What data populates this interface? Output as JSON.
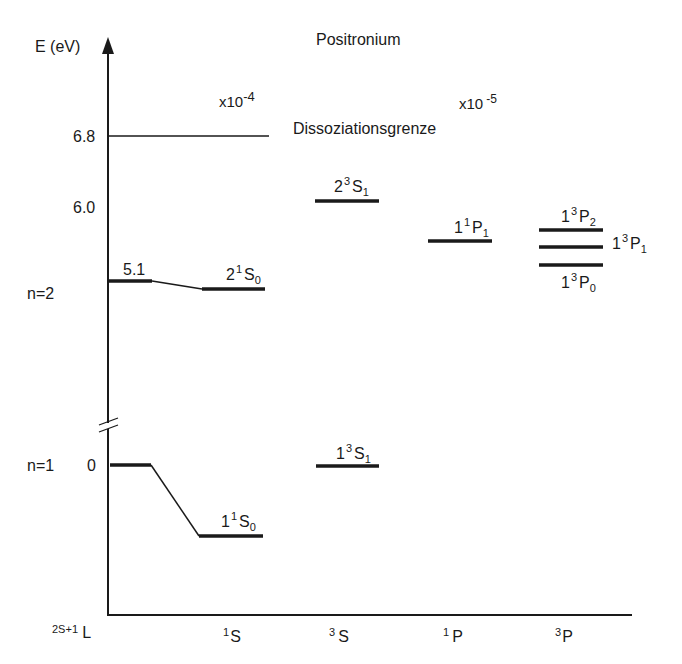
{
  "title": "Positronium",
  "y_axis": {
    "label": "E (eV)",
    "ticks": [
      "6.8",
      "6.0"
    ],
    "shell_labels": [
      "n=2",
      "n=1"
    ],
    "zero_label": "0",
    "level_value_n2": "5.1"
  },
  "x_axis": {
    "label_prefix": "2S+1",
    "label_main": "L",
    "categories": [
      {
        "mult": "1",
        "l": "S"
      },
      {
        "mult": "3",
        "l": "S"
      },
      {
        "mult": "1",
        "l": "P"
      },
      {
        "mult": "3",
        "l": "P"
      }
    ]
  },
  "scale_factors": [
    {
      "base": "x10",
      "exp": "-4"
    },
    {
      "base": "x10",
      "exp": "-5"
    }
  ],
  "dissociation_label": "Dissoziationsgrenze",
  "states": [
    {
      "n": "2",
      "mult": "3",
      "term": "S",
      "j": "1"
    },
    {
      "n": "1",
      "mult": "1",
      "term": "P",
      "j": "1"
    },
    {
      "n": "1",
      "mult": "3",
      "term": "P",
      "j": "2"
    },
    {
      "n": "1",
      "mult": "3",
      "term": "P",
      "j": "1"
    },
    {
      "n": "2",
      "mult": "1",
      "term": "S",
      "j": "0"
    },
    {
      "n": "1",
      "mult": "3",
      "term": "P",
      "j": "0"
    },
    {
      "n": "1",
      "mult": "3",
      "term": "S",
      "j": "1"
    },
    {
      "n": "1",
      "mult": "1",
      "term": "S",
      "j": "0"
    }
  ],
  "colors": {
    "line": "#1a1a1a",
    "background": "#ffffff"
  }
}
